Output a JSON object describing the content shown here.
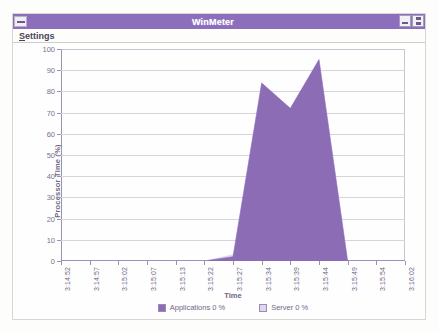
{
  "window": {
    "title": "WinMeter",
    "sysmenu_icon": "system-menu-icon",
    "minimize_icon": "minimize-icon",
    "restore_icon": "restore-icon"
  },
  "menubar": {
    "items": [
      {
        "accel": "S",
        "rest": "ettings"
      }
    ]
  },
  "colors": {
    "title_bar": "#8d6ebc",
    "series_applications": "#8b6cb5",
    "series_server": "#ded7ec",
    "gridline": "#d7d4e0",
    "axis": "#9c93ae",
    "axis_text": "#6f6788"
  },
  "chart_data": {
    "type": "area",
    "title": "",
    "xlabel": "Time",
    "ylabel": "Processor Time (%)",
    "ylim": [
      0,
      100
    ],
    "ytick_step": 10,
    "yticks": [
      100,
      90,
      80,
      70,
      60,
      50,
      40,
      30,
      20,
      10,
      0
    ],
    "grid": true,
    "legend_position": "bottom",
    "categories": [
      "3:14:52",
      "3:14:57",
      "3:15:02",
      "3:15:07",
      "3:15:13",
      "3:15:22",
      "3:15:27",
      "3:15:34",
      "3:15:39",
      "3:15:44",
      "3:15:49",
      "3:15:54",
      "3:16:02"
    ],
    "series": [
      {
        "name": "Applications",
        "current_value": "0 %",
        "legend_label": "Applications  0 %",
        "fill": "#8b6cb5",
        "values": [
          0,
          0,
          0,
          0,
          0,
          0,
          2,
          84,
          72,
          95,
          0,
          0,
          0
        ]
      },
      {
        "name": "Server",
        "current_value": "0 %",
        "legend_label": "Server  0 %",
        "fill": "#ded7ec",
        "values": [
          0,
          0,
          0,
          0,
          0,
          0,
          3,
          0,
          0,
          0,
          0,
          0,
          0
        ]
      }
    ]
  },
  "cursor": {
    "icon": "mouse-pointer-icon"
  }
}
